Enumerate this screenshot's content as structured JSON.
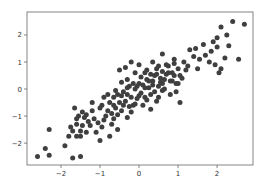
{
  "chart_data": {
    "type": "scatter",
    "title": "",
    "xlabel": "",
    "ylabel": "",
    "xlim": [
      -2.87,
      2.92
    ],
    "ylim": [
      -2.81,
      2.85
    ],
    "grid": false,
    "legend": null,
    "xticks": [
      -2,
      -1,
      0,
      1,
      2
    ],
    "xtick_labels": [
      "−2",
      "−1",
      "0",
      "1",
      "2"
    ],
    "yticks": [
      -2,
      -1,
      0,
      1,
      2
    ],
    "ytick_labels": [
      "−2",
      "−1",
      "0",
      "1",
      "2"
    ],
    "marker_color": "#3f3f3f",
    "series": [
      {
        "name": "points",
        "points": [
          [
            -2.6,
            -2.5
          ],
          [
            -2.4,
            -2.2
          ],
          [
            -2.3,
            -2.45
          ],
          [
            -2.3,
            -1.5
          ],
          [
            -1.9,
            -2.1
          ],
          [
            -1.7,
            -2.55
          ],
          [
            -1.5,
            -2.5
          ],
          [
            -1.65,
            -0.7
          ],
          [
            -1.6,
            -1.3
          ],
          [
            -1.7,
            -1.55
          ],
          [
            -1.8,
            -1.75
          ],
          [
            -1.6,
            -1.75
          ],
          [
            -1.5,
            -1.75
          ],
          [
            -1.45,
            -1.35
          ],
          [
            -1.55,
            -1.0
          ],
          [
            -1.45,
            -0.85
          ],
          [
            -1.35,
            -0.95
          ],
          [
            -1.2,
            -0.8
          ],
          [
            -1.3,
            -1.2
          ],
          [
            -1.15,
            -1.1
          ],
          [
            -1.1,
            -1.6
          ],
          [
            -1.0,
            -1.9
          ],
          [
            -0.95,
            -1.4
          ],
          [
            -0.85,
            -1.0
          ],
          [
            -0.75,
            -1.75
          ],
          [
            -0.75,
            -0.5
          ],
          [
            -0.7,
            -0.9
          ],
          [
            -0.65,
            -0.3
          ],
          [
            -0.6,
            -0.7
          ],
          [
            -0.55,
            -0.2
          ],
          [
            -0.5,
            -0.5
          ],
          [
            -0.45,
            -0.8
          ],
          [
            -0.4,
            -0.1
          ],
          [
            -0.35,
            -0.45
          ],
          [
            -0.3,
            -0.2
          ],
          [
            -0.25,
            0.1
          ],
          [
            -0.2,
            -0.3
          ],
          [
            -0.15,
            -0.6
          ],
          [
            -0.1,
            0.0
          ],
          [
            -0.05,
            -0.35
          ],
          [
            0.0,
            0.2
          ],
          [
            0.05,
            -0.15
          ],
          [
            0.1,
            0.15
          ],
          [
            0.15,
            -0.3
          ],
          [
            0.2,
            0.35
          ],
          [
            0.25,
            0.05
          ],
          [
            0.3,
            -0.2
          ],
          [
            0.35,
            0.3
          ],
          [
            0.4,
            0.5
          ],
          [
            0.45,
            -0.45
          ],
          [
            0.5,
            0.1
          ],
          [
            0.55,
            0.4
          ],
          [
            0.6,
            0.2
          ],
          [
            0.65,
            0.0
          ],
          [
            0.7,
            0.55
          ],
          [
            0.75,
            0.85
          ],
          [
            0.8,
            0.3
          ],
          [
            0.85,
            0.6
          ],
          [
            0.9,
            0.95
          ],
          [
            0.95,
            0.2
          ],
          [
            -0.5,
            0.7
          ],
          [
            -0.35,
            0.8
          ],
          [
            -0.2,
            1.0
          ],
          [
            -0.1,
            0.6
          ],
          [
            0.0,
            0.9
          ],
          [
            0.2,
            0.7
          ],
          [
            0.35,
            1.0
          ],
          [
            0.5,
            0.85
          ],
          [
            0.6,
            1.3
          ],
          [
            0.75,
            0.6
          ],
          [
            0.85,
            0.3
          ],
          [
            0.8,
            -0.2
          ],
          [
            0.95,
            -0.1
          ],
          [
            1.05,
            -0.5
          ],
          [
            1.0,
            0.2
          ],
          [
            1.05,
            0.5
          ],
          [
            1.15,
            1.0
          ],
          [
            1.2,
            0.7
          ],
          [
            1.3,
            1.45
          ],
          [
            1.4,
            1.2
          ],
          [
            1.5,
            0.75
          ],
          [
            1.55,
            1.1
          ],
          [
            1.7,
            1.25
          ],
          [
            1.85,
            1.4
          ],
          [
            1.9,
            1.75
          ],
          [
            1.95,
            0.9
          ],
          [
            2.0,
            1.55
          ],
          [
            2.05,
            0.6
          ],
          [
            2.1,
            0.75
          ],
          [
            2.2,
            1.15
          ],
          [
            2.25,
            2.0
          ],
          [
            2.1,
            2.3
          ],
          [
            2.4,
            2.5
          ],
          [
            2.55,
            1.1
          ],
          [
            2.7,
            2.4
          ],
          [
            -1.2,
            -0.5
          ],
          [
            -1.0,
            -0.7
          ],
          [
            -0.9,
            -0.3
          ],
          [
            -0.8,
            -0.8
          ],
          [
            -0.65,
            -1.1
          ],
          [
            -0.55,
            -0.95
          ],
          [
            -0.4,
            -0.6
          ],
          [
            -0.3,
            -1.05
          ],
          [
            -0.2,
            -0.85
          ],
          [
            -0.1,
            -0.55
          ],
          [
            0.1,
            -0.6
          ],
          [
            0.2,
            -0.4
          ],
          [
            0.3,
            -0.75
          ],
          [
            0.4,
            -0.1
          ],
          [
            0.5,
            -0.3
          ],
          [
            -0.6,
            -0.05
          ],
          [
            -0.45,
            0.25
          ],
          [
            -0.3,
            0.35
          ],
          [
            -0.15,
            0.2
          ],
          [
            0.05,
            0.45
          ],
          [
            0.15,
            0.6
          ],
          [
            0.3,
            0.55
          ],
          [
            0.45,
            0.75
          ],
          [
            0.6,
            0.65
          ],
          [
            0.7,
            0.9
          ],
          [
            -1.4,
            -1.05
          ],
          [
            -1.25,
            -1.35
          ],
          [
            -1.05,
            -1.25
          ],
          [
            -0.9,
            -1.15
          ],
          [
            -0.7,
            -1.3
          ],
          [
            -0.55,
            -1.5
          ],
          [
            -1.6,
            -1.1
          ],
          [
            -1.75,
            -1.4
          ],
          [
            -1.5,
            -1.55
          ],
          [
            -1.35,
            -1.6
          ],
          [
            -0.3,
            0.05
          ],
          [
            -0.05,
            0.1
          ],
          [
            0.25,
            0.3
          ],
          [
            0.55,
            0.25
          ],
          [
            0.65,
            0.35
          ],
          [
            0.9,
            0.5
          ],
          [
            1.0,
            0.75
          ],
          [
            0.9,
            1.1
          ],
          [
            1.1,
            0.4
          ],
          [
            1.25,
            0.85
          ],
          [
            1.45,
            1.5
          ],
          [
            1.65,
            1.65
          ],
          [
            1.8,
            1.0
          ],
          [
            2.0,
            1.9
          ],
          [
            2.3,
            1.6
          ],
          [
            -0.95,
            -0.6
          ],
          [
            -0.8,
            -0.2
          ],
          [
            -0.65,
            -0.6
          ],
          [
            -0.45,
            -0.25
          ],
          [
            -0.25,
            -0.65
          ],
          [
            0.0,
            -0.25
          ],
          [
            0.15,
            0.05
          ],
          [
            0.35,
            0.15
          ],
          [
            0.45,
            0.55
          ],
          [
            0.6,
            -0.05
          ]
        ]
      }
    ]
  }
}
